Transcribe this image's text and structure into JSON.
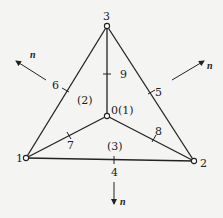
{
  "diagram": {
    "colors": {
      "stroke": "#222222",
      "background": "#f4f4f2"
    },
    "nodes": [
      {
        "id": "0",
        "label": "0",
        "x": 107,
        "y": 116
      },
      {
        "id": "1",
        "label": "1",
        "x": 26,
        "y": 158
      },
      {
        "id": "2",
        "label": "2",
        "x": 194,
        "y": 161
      },
      {
        "id": "3",
        "label": "3",
        "x": 107,
        "y": 26
      }
    ],
    "edges": [
      {
        "from": "1",
        "to": "2",
        "midpoint_label": "4"
      },
      {
        "from": "2",
        "to": "3",
        "midpoint_label": "5"
      },
      {
        "from": "3",
        "to": "1",
        "midpoint_label": "6"
      },
      {
        "from": "1",
        "to": "0",
        "midpoint_label": "7"
      },
      {
        "from": "0",
        "to": "2",
        "midpoint_label": "8"
      },
      {
        "from": "3",
        "to": "0",
        "midpoint_label": "9"
      }
    ],
    "elements": [
      {
        "label": "(1)"
      },
      {
        "label": "(2)"
      },
      {
        "label": "(3)"
      }
    ],
    "normals": [
      {
        "label": "n",
        "side": "left"
      },
      {
        "label": "n",
        "side": "right"
      },
      {
        "label": "n",
        "side": "bottom"
      }
    ]
  }
}
